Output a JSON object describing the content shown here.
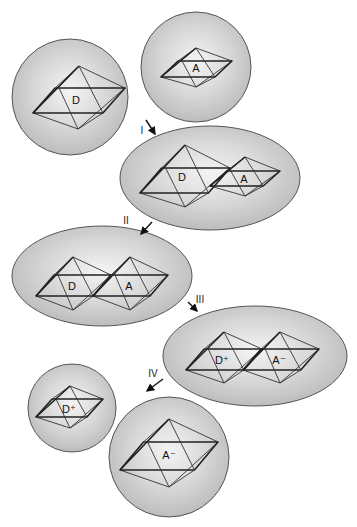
{
  "figure": {
    "steps": [
      {
        "label": "I",
        "x": 142,
        "y": 134,
        "arrow": [
          146,
          120,
          155,
          134
        ]
      },
      {
        "label": "II",
        "x": 126,
        "y": 224,
        "arrow": [
          152,
          222,
          141,
          234
        ]
      },
      {
        "label": "III",
        "x": 200,
        "y": 303,
        "arrow": [
          188,
          302,
          197,
          311
        ]
      },
      {
        "label": "IV",
        "x": 153,
        "y": 377,
        "arrow": [
          163,
          379,
          147,
          391
        ]
      }
    ],
    "shells": [
      {
        "id": "donor-shell",
        "cx": 70,
        "cy": 97,
        "rx": 58,
        "ry": 58
      },
      {
        "id": "acceptor-shell",
        "cx": 196,
        "cy": 67,
        "rx": 55,
        "ry": 55
      },
      {
        "id": "precursor-shell",
        "cx": 210,
        "cy": 178,
        "rx": 90,
        "ry": 52
      },
      {
        "id": "activated-shell",
        "cx": 102,
        "cy": 276,
        "rx": 90,
        "ry": 50
      },
      {
        "id": "successor-shell",
        "cx": 255,
        "cy": 356,
        "rx": 92,
        "ry": 50
      },
      {
        "id": "donor-plus-shell",
        "cx": 72,
        "cy": 408,
        "rx": 44,
        "ry": 44
      },
      {
        "id": "acceptor-minus-shell",
        "cx": 169,
        "cy": 457,
        "rx": 60,
        "ry": 60
      }
    ],
    "complexes": [
      {
        "label": "D",
        "top": [
          79,
          66
        ],
        "right": [
          125,
          88
        ],
        "left": [
          33,
          113
        ],
        "bottom": [
          78,
          129
        ],
        "tx": 76,
        "ty": 104
      },
      {
        "label": "A",
        "top": [
          196,
          48
        ],
        "right": [
          232,
          61
        ],
        "left": [
          161,
          77
        ],
        "bottom": [
          196,
          87
        ],
        "tx": 196,
        "ty": 72
      },
      {
        "label": "D",
        "top": [
          185,
          145
        ],
        "right": [
          230,
          168
        ],
        "left": [
          140,
          193
        ],
        "bottom": [
          185,
          207
        ],
        "tx": 182,
        "ty": 181
      },
      {
        "label": "A",
        "top": [
          245,
          157
        ],
        "right": [
          280,
          171
        ],
        "left": [
          210,
          186
        ],
        "bottom": [
          245,
          196
        ],
        "tx": 244,
        "ty": 183
      },
      {
        "label": "D",
        "top": [
          73,
          257
        ],
        "right": [
          111,
          275
        ],
        "left": [
          36,
          296
        ],
        "bottom": [
          73,
          310
        ],
        "tx": 72,
        "ty": 290
      },
      {
        "label": "A",
        "top": [
          130,
          257
        ],
        "right": [
          168,
          275
        ],
        "left": [
          93,
          296
        ],
        "bottom": [
          130,
          310
        ],
        "tx": 129,
        "ty": 290
      },
      {
        "label": "D⁺",
        "top": [
          224,
          332
        ],
        "right": [
          262,
          349
        ],
        "left": [
          186,
          370
        ],
        "bottom": [
          224,
          383
        ],
        "tx": 222,
        "ty": 364
      },
      {
        "label": "A⁻",
        "top": [
          280,
          332
        ],
        "right": [
          319,
          349
        ],
        "left": [
          243,
          370
        ],
        "bottom": [
          280,
          383
        ],
        "tx": 279,
        "ty": 364
      },
      {
        "label": "D⁺",
        "top": [
          70,
          386
        ],
        "right": [
          103,
          399
        ],
        "left": [
          36,
          417
        ],
        "bottom": [
          70,
          428
        ],
        "tx": 69,
        "ty": 413
      },
      {
        "label": "A⁻",
        "top": [
          169,
          419
        ],
        "right": [
          218,
          442
        ],
        "left": [
          120,
          470
        ],
        "bottom": [
          169,
          487
        ],
        "tx": 169,
        "ty": 459
      }
    ]
  }
}
